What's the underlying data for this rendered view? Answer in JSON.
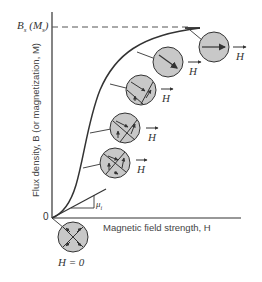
{
  "figure": {
    "type": "magnetization-curve-diagram",
    "y_axis_label": "Flux density, B (or magnetization, M)",
    "x_axis_label": "Magnetic field strength, H",
    "origin_label": "0",
    "saturation_label": "B_s (M_s)",
    "saturation_label_main": "B",
    "saturation_label_sub": "s",
    "saturation_label_paren_main": "(M",
    "saturation_label_paren_sub": "s",
    "saturation_label_paren_close": ")",
    "initial_permeability_label": "μi",
    "initial_permeability_main": "μ",
    "initial_permeability_sub": "i",
    "zero_field_label": "H = 0",
    "field_arrow_label": "H",
    "domain_states": [
      {
        "stage": 0,
        "description": "demagnetized, four domains, H = 0"
      },
      {
        "stage": 1,
        "description": "domain walls begin to move"
      },
      {
        "stage": 2,
        "description": "favorably oriented domains grow"
      },
      {
        "stage": 3,
        "description": "further domain growth"
      },
      {
        "stage": 4,
        "description": "single domain, rotating"
      },
      {
        "stage": 5,
        "description": "saturated, aligned with H"
      }
    ]
  },
  "colors": {
    "line": "#333333",
    "domain_fill": "#c8c8c8",
    "dashed": "#555555"
  }
}
